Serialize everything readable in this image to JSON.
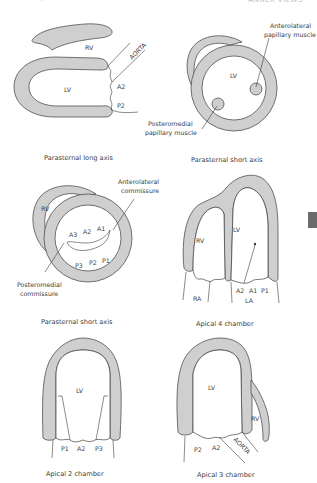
{
  "header": {
    "running_head": "ANNEX VIEWS",
    "left_fragment": "—"
  },
  "thumb_tab": {
    "color": "#6b6b6b"
  },
  "colors": {
    "wall": "#cfcfcf",
    "stroke": "#3c3c3c",
    "background": "#ffffff"
  },
  "panels": [
    {
      "id": "plax",
      "caption": "Parasternal long axis",
      "labels": {
        "rv": "RV",
        "aorta": "AORTA",
        "lv": "LV",
        "a2": "A2",
        "p2": "P2"
      }
    },
    {
      "id": "psax-pap",
      "caption": "Parasternal short axis",
      "labels": {
        "lv": "LV",
        "antero_1": "Anterolateral",
        "antero_2": "papillary muscle",
        "postero_1": "Posteromedial",
        "postero_2": "papillary muscle"
      }
    },
    {
      "id": "psax-mv",
      "caption": "Parasternal short axis",
      "labels": {
        "rv": "RV",
        "a1": "A1",
        "a2": "A2",
        "a3": "A3",
        "p1": "P1",
        "p2": "P2",
        "p3": "P3",
        "antero_1": "Anterolateral",
        "antero_2": "commissure",
        "postero_1": "Posteromedial",
        "postero_2": "commissure"
      }
    },
    {
      "id": "a4c",
      "caption": "Apical 4 chamber",
      "labels": {
        "lv": "LV",
        "rv": "RV",
        "ra": "RA",
        "la": "LA",
        "a2": "A2",
        "a1": "A1",
        "p1": "P1"
      }
    },
    {
      "id": "a2c",
      "caption": "Apical 2 chamber",
      "labels": {
        "lv": "LV",
        "p1": "P1",
        "a2": "A2",
        "p3": "P3"
      }
    },
    {
      "id": "a3c",
      "caption": "Apical 3 chamber",
      "labels": {
        "lv": "LV",
        "rv": "RV",
        "p2": "P2",
        "a2": "A2",
        "aorta": "AORTA"
      }
    }
  ]
}
